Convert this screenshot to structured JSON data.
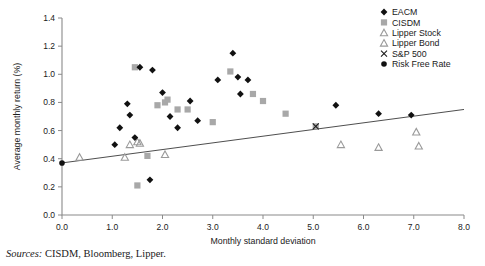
{
  "source_note": {
    "label": "Sources:",
    "text": "CISDM, Bloomberg, Lipper."
  },
  "legend": {
    "items": [
      {
        "label": "EACM",
        "marker": "diamond",
        "color": "#111111"
      },
      {
        "label": "CISDM",
        "marker": "square",
        "color": "#a8a8a8"
      },
      {
        "label": "Lipper Stock",
        "marker": "triangle",
        "color": "#9a9a9a"
      },
      {
        "label": "Lipper Bond",
        "marker": "triangle",
        "color": "#9a9a9a"
      },
      {
        "label": "S&P 500",
        "marker": "x",
        "color": "#1a1a1a"
      },
      {
        "label": "Risk Free Rate",
        "marker": "dot",
        "color": "#111111"
      }
    ]
  },
  "chart_data": {
    "type": "scatter",
    "title": "",
    "xlabel": "Monthly standard deviation",
    "ylabel": "Average monthly return (%)",
    "xlim": [
      0.0,
      8.0
    ],
    "ylim": [
      0.0,
      1.4
    ],
    "xticks": [
      "0.0",
      "1.0",
      "2.0",
      "3.0",
      "4.0",
      "5.0",
      "6.0",
      "7.0",
      "8.0"
    ],
    "yticks": [
      "0.0",
      "0.2",
      "0.4",
      "0.6",
      "0.8",
      "1.0",
      "1.2",
      "1.4"
    ],
    "grid": false,
    "legend_position": "top-right",
    "trendline": {
      "x": [
        0.0,
        8.0
      ],
      "y": [
        0.37,
        0.75
      ]
    },
    "series": [
      {
        "name": "EACM",
        "marker": "diamond",
        "color": "#111111",
        "points": [
          [
            1.05,
            0.5
          ],
          [
            1.15,
            0.62
          ],
          [
            1.3,
            0.79
          ],
          [
            1.35,
            0.71
          ],
          [
            1.45,
            0.55
          ],
          [
            1.55,
            1.05
          ],
          [
            1.75,
            0.25
          ],
          [
            1.8,
            1.03
          ],
          [
            2.0,
            0.87
          ],
          [
            2.15,
            0.7
          ],
          [
            2.3,
            0.62
          ],
          [
            2.55,
            0.81
          ],
          [
            2.7,
            0.67
          ],
          [
            3.1,
            0.96
          ],
          [
            3.4,
            1.15
          ],
          [
            3.5,
            0.98
          ],
          [
            3.7,
            0.96
          ],
          [
            3.55,
            0.86
          ],
          [
            5.45,
            0.78
          ],
          [
            6.3,
            0.72
          ],
          [
            6.95,
            0.71
          ]
        ]
      },
      {
        "name": "CISDM",
        "marker": "square",
        "color": "#a8a8a8",
        "points": [
          [
            1.45,
            1.05
          ],
          [
            1.5,
            0.21
          ],
          [
            1.7,
            0.42
          ],
          [
            1.9,
            0.78
          ],
          [
            2.05,
            0.8
          ],
          [
            2.1,
            0.82
          ],
          [
            2.3,
            0.75
          ],
          [
            2.5,
            0.75
          ],
          [
            3.0,
            0.66
          ],
          [
            3.35,
            1.02
          ],
          [
            3.8,
            0.86
          ],
          [
            4.0,
            0.81
          ],
          [
            4.45,
            0.72
          ],
          [
            5.05,
            0.63
          ]
        ]
      },
      {
        "name": "Lipper Stock",
        "marker": "triangle",
        "color": "#9a9a9a",
        "points": [
          [
            1.35,
            0.5
          ],
          [
            1.5,
            0.52
          ],
          [
            1.55,
            0.51
          ]
        ]
      },
      {
        "name": "Lipper Bond",
        "marker": "triangle",
        "color": "#9a9a9a",
        "points": [
          [
            0.35,
            0.41
          ],
          [
            1.25,
            0.41
          ],
          [
            2.05,
            0.43
          ],
          [
            5.55,
            0.5
          ],
          [
            6.3,
            0.48
          ],
          [
            7.05,
            0.59
          ],
          [
            7.1,
            0.49
          ]
        ]
      },
      {
        "name": "S&P 500",
        "marker": "x",
        "color": "#1a1a1a",
        "points": [
          [
            5.05,
            0.63
          ]
        ]
      },
      {
        "name": "Risk Free Rate",
        "marker": "dot",
        "color": "#111111",
        "points": [
          [
            0.0,
            0.37
          ]
        ]
      }
    ]
  }
}
